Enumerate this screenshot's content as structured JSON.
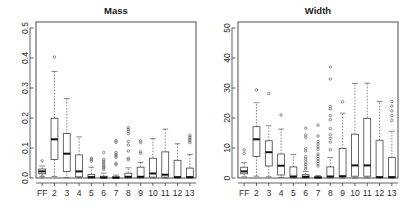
{
  "figure": {
    "width": 404,
    "height": 218,
    "background": "#ffffff",
    "panel_count": 2
  },
  "chart_data": [
    {
      "type": "box",
      "panel": "left",
      "title": "Mass",
      "xlabel": "",
      "ylabel": "",
      "grid": false,
      "legend": "none",
      "categories": [
        "FF",
        "2",
        "3",
        "4",
        "5",
        "6",
        "7",
        "8",
        "9",
        "10",
        "11",
        "12",
        "13"
      ],
      "ylim": [
        0,
        0.52
      ],
      "yticks": [
        0.0,
        0.1,
        0.2,
        0.3,
        0.4,
        0.5
      ],
      "ytick_labels": [
        "0.0",
        "0.1",
        "0.2",
        "0.3",
        "0.4",
        "0.5"
      ],
      "boxes": [
        {
          "category": "FF",
          "lower_whisker": 0.004,
          "q1": 0.014,
          "median": 0.022,
          "q3": 0.03,
          "upper_whisker": 0.04,
          "outliers": [
            0.057,
            0.006
          ]
        },
        {
          "category": "2",
          "lower_whisker": 0.005,
          "q1": 0.062,
          "median": 0.129,
          "q3": 0.199,
          "upper_whisker": 0.355,
          "outliers": [
            0.403
          ]
        },
        {
          "category": "3",
          "lower_whisker": 0.002,
          "q1": 0.022,
          "median": 0.081,
          "q3": 0.148,
          "upper_whisker": 0.265,
          "outliers": []
        },
        {
          "category": "4",
          "lower_whisker": 0.001,
          "q1": 0.004,
          "median": 0.022,
          "q3": 0.077,
          "upper_whisker": 0.137,
          "outliers": []
        },
        {
          "category": "5",
          "lower_whisker": 0.0,
          "q1": 0.001,
          "median": 0.003,
          "q3": 0.012,
          "upper_whisker": 0.036,
          "outliers": [
            0.056,
            0.062,
            0.066
          ]
        },
        {
          "category": "6",
          "lower_whisker": 0.0,
          "q1": 0.0,
          "median": 0.002,
          "q3": 0.006,
          "upper_whisker": 0.016,
          "outliers": [
            0.028,
            0.034,
            0.038,
            0.044,
            0.05,
            0.056,
            0.062,
            0.085
          ]
        },
        {
          "category": "7",
          "lower_whisker": 0.0,
          "q1": 0.0,
          "median": 0.001,
          "q3": 0.004,
          "upper_whisker": 0.01,
          "outliers": [
            0.044,
            0.049,
            0.069,
            0.074,
            0.079,
            0.085,
            0.119,
            0.124
          ]
        },
        {
          "category": "8",
          "lower_whisker": 0.0,
          "q1": 0.002,
          "median": 0.004,
          "q3": 0.016,
          "upper_whisker": 0.034,
          "outliers": [
            0.061,
            0.066,
            0.09,
            0.11,
            0.122,
            0.148,
            0.156,
            0.162,
            0.168
          ]
        },
        {
          "category": "9",
          "lower_whisker": 0.0,
          "q1": 0.002,
          "median": 0.004,
          "q3": 0.036,
          "upper_whisker": 0.052,
          "outliers": [
            0.082,
            0.088,
            0.118,
            0.124
          ]
        },
        {
          "category": "10",
          "lower_whisker": 0.0,
          "q1": 0.003,
          "median": 0.015,
          "q3": 0.066,
          "upper_whisker": 0.131,
          "outliers": []
        },
        {
          "category": "11",
          "lower_whisker": 0.0,
          "q1": 0.003,
          "median": 0.011,
          "q3": 0.087,
          "upper_whisker": 0.163,
          "outliers": []
        },
        {
          "category": "12",
          "lower_whisker": 0.0,
          "q1": 0.001,
          "median": 0.003,
          "q3": 0.059,
          "upper_whisker": 0.114,
          "outliers": []
        },
        {
          "category": "13",
          "lower_whisker": 0.0,
          "q1": 0.001,
          "median": 0.003,
          "q3": 0.033,
          "upper_whisker": 0.078,
          "outliers": [
            0.118,
            0.124,
            0.13,
            0.136,
            0.142
          ]
        }
      ]
    },
    {
      "type": "box",
      "panel": "right",
      "title": "Width",
      "xlabel": "",
      "ylabel": "",
      "grid": false,
      "legend": "none",
      "categories": [
        "FF",
        "2",
        "3",
        "4",
        "5",
        "6",
        "7",
        "8",
        "9",
        "10",
        "11",
        "12",
        "13"
      ],
      "ylim": [
        0,
        52
      ],
      "yticks": [
        0,
        10,
        20,
        30,
        40,
        50
      ],
      "ytick_labels": [
        "0",
        "10",
        "20",
        "30",
        "40",
        "50"
      ],
      "boxes": [
        {
          "category": "FF",
          "lower_whisker": 0.4,
          "q1": 1.4,
          "median": 2.2,
          "q3": 3.6,
          "upper_whisker": 5.1,
          "outliers": [
            8.2,
            9.4
          ]
        },
        {
          "category": "2",
          "lower_whisker": 0.6,
          "q1": 7.2,
          "median": 12.9,
          "q3": 17.1,
          "upper_whisker": 25.1,
          "outliers": [
            29.3
          ]
        },
        {
          "category": "3",
          "lower_whisker": 0.4,
          "q1": 4.0,
          "median": 8.6,
          "q3": 12.4,
          "upper_whisker": 17.4,
          "outliers": [
            28.1
          ]
        },
        {
          "category": "4",
          "lower_whisker": 0.2,
          "q1": 1.0,
          "median": 4.1,
          "q3": 8.0,
          "upper_whisker": 16.3,
          "outliers": [
            21.0
          ]
        },
        {
          "category": "5",
          "lower_whisker": 0.0,
          "q1": 0.2,
          "median": 0.5,
          "q3": 3.7,
          "upper_whisker": 7.8,
          "outliers": []
        },
        {
          "category": "6",
          "lower_whisker": 0.0,
          "q1": 0.1,
          "median": 0.4,
          "q3": 1.1,
          "upper_whisker": 2.2,
          "outliers": [
            3.0,
            3.8,
            4.6,
            5.4,
            6.3,
            7.1,
            9.0,
            9.8,
            13.5,
            14.3,
            16.6
          ]
        },
        {
          "category": "7",
          "lower_whisker": 0.0,
          "q1": 0.0,
          "median": 0.2,
          "q3": 0.4,
          "upper_whisker": 0.8,
          "outliers": [
            4.0,
            4.8,
            5.6,
            6.4,
            7.2,
            8.0,
            9.6,
            10.4,
            11.3,
            12.1,
            14.0,
            17.6
          ]
        },
        {
          "category": "8",
          "lower_whisker": 0.0,
          "q1": 0.4,
          "median": 0.5,
          "q3": 3.7,
          "upper_whisker": 6.8,
          "outliers": [
            9.4,
            12.0,
            13.2,
            14.4,
            16.5,
            19.4,
            20.8,
            23.0,
            23.8,
            33.0,
            37.0
          ]
        },
        {
          "category": "9",
          "lower_whisker": 0.0,
          "q1": 0.4,
          "median": 0.6,
          "q3": 9.8,
          "upper_whisker": 21.6,
          "outliers": [
            25.4
          ]
        },
        {
          "category": "10",
          "lower_whisker": 0.0,
          "q1": 0.6,
          "median": 4.2,
          "q3": 14.6,
          "upper_whisker": 31.5,
          "outliers": []
        },
        {
          "category": "11",
          "lower_whisker": 0.0,
          "q1": 0.6,
          "median": 4.2,
          "q3": 19.9,
          "upper_whisker": 31.6,
          "outliers": []
        },
        {
          "category": "12",
          "lower_whisker": 0.0,
          "q1": 0.2,
          "median": 0.3,
          "q3": 12.6,
          "upper_whisker": 25.5,
          "outliers": []
        },
        {
          "category": "13",
          "lower_whisker": 0.0,
          "q1": 0.2,
          "median": 0.3,
          "q3": 6.8,
          "upper_whisker": 15.6,
          "outliers": [
            19.2,
            20.8,
            22.4,
            24.0,
            25.5
          ]
        }
      ]
    }
  ],
  "colors": {
    "axis": "#3a3a3a",
    "box_stroke": "#444444",
    "median": "#111111",
    "whisker": "#555555",
    "outlier": "#555555",
    "text": "#2b2b2b",
    "background": "#ffffff"
  }
}
